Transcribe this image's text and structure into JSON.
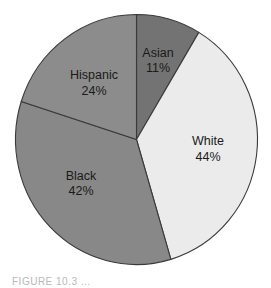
{
  "chart_data": {
    "type": "pie",
    "title": "",
    "categories": [
      "Asian",
      "White",
      "Black",
      "Hispanic"
    ],
    "values": [
      11,
      44,
      42,
      24
    ],
    "unit": "%",
    "labels": [
      {
        "name": "Asian",
        "value_text": "11%"
      },
      {
        "name": "White",
        "value_text": "44%"
      },
      {
        "name": "Black",
        "value_text": "42%"
      },
      {
        "name": "Hispanic",
        "value_text": "24%"
      }
    ],
    "legend": "none (labels inside slices)",
    "start_angle": "12 o'clock, clockwise"
  },
  "render": {
    "center": {
      "x": 136.5,
      "y": 139.5
    },
    "radius": {
      "rx": 121,
      "ry": 125
    },
    "outline_color": "#3a3a3a",
    "slices": [
      {
        "name": "Asian",
        "start_deg": 0,
        "end_deg": 31,
        "color": "#737373",
        "label_x": 158,
        "label_y1": 57,
        "label_y2": 72
      },
      {
        "name": "White",
        "start_deg": 31,
        "end_deg": 163.5,
        "color": "#ebebeb",
        "label_x": 208,
        "label_y1": 145,
        "label_y2": 161
      },
      {
        "name": "Black",
        "start_deg": 163.5,
        "end_deg": 287.7,
        "color": "#888888",
        "label_x": 81,
        "label_y1": 180,
        "label_y2": 195
      },
      {
        "name": "Hispanic",
        "start_deg": 287.7,
        "end_deg": 360,
        "color": "#8c8c8c",
        "label_x": 94,
        "label_y1": 79,
        "label_y2": 95
      }
    ]
  },
  "caption": {
    "text": "FIGURE 10.3  ..."
  }
}
